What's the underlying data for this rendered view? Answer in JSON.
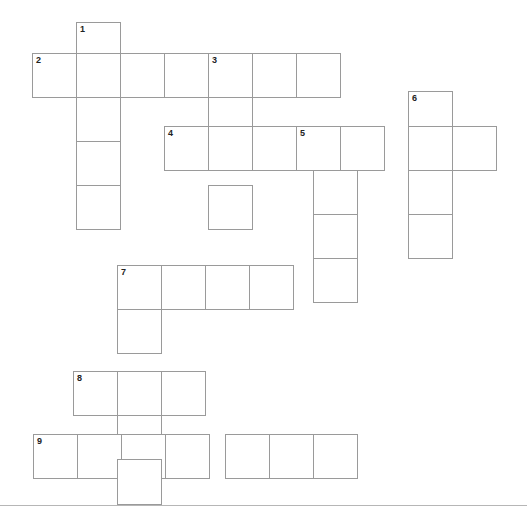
{
  "puzzle": {
    "title": "Crossword Puzzle Grid",
    "cell_size": 44.5,
    "origin_x": 32.5,
    "origin_y": 22,
    "columns": 11,
    "rows": 11,
    "grid_line_color": "#9a9a9a",
    "cell_fill_color": "#ffffff",
    "number_color": "#222222",
    "background_color": "#ffffff",
    "baseline_rule": {
      "y": 505,
      "color": "#b6b6b6"
    },
    "entries": [
      {
        "number": "1",
        "direction": "down",
        "col": 1,
        "row": 0,
        "length": 1
      },
      {
        "number": "2",
        "direction": "across",
        "col": 0,
        "row": 1,
        "length": 8
      },
      {
        "number": "3",
        "direction": "down",
        "col": 4,
        "row": 1,
        "length": 1
      },
      {
        "number": "4",
        "direction": "across",
        "col": 3,
        "row": 3,
        "length": 8
      },
      {
        "number": "5",
        "direction": "down",
        "col": 6,
        "row": 3,
        "length": 1
      },
      {
        "number": "6",
        "direction": "down",
        "col": 8,
        "row": 2,
        "length": 1
      },
      {
        "number": "7",
        "direction": "across",
        "col": 2,
        "row": 6,
        "length": 6
      },
      {
        "number": "8",
        "direction": "across",
        "col": 1,
        "row": 8,
        "length": 4
      },
      {
        "number": "9",
        "direction": "across",
        "col": 0,
        "row": 10,
        "length": 8
      }
    ],
    "cells": [
      {
        "name": "cell-r0c1",
        "x": 76,
        "y": 22,
        "w": 45,
        "h": 45,
        "number": "1",
        "letter": ""
      },
      {
        "name": "cell-r1c0",
        "x": 32,
        "y": 53,
        "w": 45,
        "h": 45,
        "number": "2",
        "letter": ""
      },
      {
        "name": "cell-r1c1",
        "x": 76,
        "y": 53,
        "w": 45,
        "h": 45,
        "number": "",
        "letter": ""
      },
      {
        "name": "cell-r1c2",
        "x": 120,
        "y": 53,
        "w": 45,
        "h": 45,
        "number": "",
        "letter": ""
      },
      {
        "name": "cell-r1c3",
        "x": 164,
        "y": 53,
        "w": 45,
        "h": 45,
        "number": "",
        "letter": ""
      },
      {
        "name": "cell-r1c4",
        "x": 208,
        "y": 53,
        "w": 45,
        "h": 45,
        "number": "3",
        "letter": ""
      },
      {
        "name": "cell-r1c5",
        "x": 252,
        "y": 53,
        "w": 45,
        "h": 45,
        "number": "",
        "letter": ""
      },
      {
        "name": "cell-r1c6",
        "x": 296,
        "y": 53,
        "w": 45,
        "h": 45,
        "number": "",
        "letter": ""
      },
      {
        "name": "cell-r2c1",
        "x": 76,
        "y": 97,
        "w": 45,
        "h": 45,
        "number": "",
        "letter": ""
      },
      {
        "name": "cell-r2c4",
        "x": 208,
        "y": 97,
        "w": 45,
        "h": 45,
        "number": "",
        "letter": ""
      },
      {
        "name": "cell-r2c8",
        "x": 408,
        "y": 91,
        "w": 45,
        "h": 45,
        "number": "6",
        "letter": ""
      },
      {
        "name": "cell-r3c1",
        "x": 76,
        "y": 141,
        "w": 45,
        "h": 45,
        "number": "",
        "letter": ""
      },
      {
        "name": "cell-r3c3",
        "x": 164,
        "y": 126,
        "w": 45,
        "h": 45,
        "number": "4",
        "letter": ""
      },
      {
        "name": "cell-r3c4",
        "x": 208,
        "y": 126,
        "w": 45,
        "h": 45,
        "number": "",
        "letter": ""
      },
      {
        "name": "cell-r3c5",
        "x": 252,
        "y": 126,
        "w": 45,
        "h": 45,
        "number": "",
        "letter": ""
      },
      {
        "name": "cell-r3c6",
        "x": 296,
        "y": 126,
        "w": 45,
        "h": 45,
        "number": "5",
        "letter": ""
      },
      {
        "name": "cell-r3c7",
        "x": 340,
        "y": 126,
        "w": 45,
        "h": 45,
        "number": "",
        "letter": ""
      },
      {
        "name": "cell-r3c8",
        "x": 408,
        "y": 126,
        "w": 45,
        "h": 45,
        "number": "",
        "letter": ""
      },
      {
        "name": "cell-r3c9",
        "x": 452,
        "y": 126,
        "w": 45,
        "h": 45,
        "number": "",
        "letter": ""
      },
      {
        "name": "cell-r4c1",
        "x": 76,
        "y": 185,
        "w": 45,
        "h": 45,
        "number": "",
        "letter": ""
      },
      {
        "name": "cell-r4c4",
        "x": 208,
        "y": 185,
        "w": 45,
        "h": 45,
        "number": "",
        "letter": ""
      },
      {
        "name": "cell-r4c6",
        "x": 313,
        "y": 170,
        "w": 45,
        "h": 45,
        "number": "",
        "letter": ""
      },
      {
        "name": "cell-r4c8",
        "x": 408,
        "y": 170,
        "w": 45,
        "h": 45,
        "number": "",
        "letter": ""
      },
      {
        "name": "cell-r5c6",
        "x": 313,
        "y": 214,
        "w": 45,
        "h": 45,
        "number": "",
        "letter": ""
      },
      {
        "name": "cell-r5c8",
        "x": 408,
        "y": 214,
        "w": 45,
        "h": 45,
        "number": "",
        "letter": ""
      },
      {
        "name": "cell-r6c2",
        "x": 117,
        "y": 265,
        "w": 45,
        "h": 45,
        "number": "7",
        "letter": ""
      },
      {
        "name": "cell-r6c3",
        "x": 161,
        "y": 265,
        "w": 45,
        "h": 45,
        "number": "",
        "letter": ""
      },
      {
        "name": "cell-r6c4",
        "x": 205,
        "y": 265,
        "w": 45,
        "h": 45,
        "number": "",
        "letter": ""
      },
      {
        "name": "cell-r6c5",
        "x": 249,
        "y": 265,
        "w": 45,
        "h": 45,
        "number": "",
        "letter": ""
      },
      {
        "name": "cell-r6c6",
        "x": 313,
        "y": 258,
        "w": 45,
        "h": 45,
        "number": "",
        "letter": ""
      },
      {
        "name": "cell-r7c2",
        "x": 117,
        "y": 309,
        "w": 45,
        "h": 45,
        "number": "",
        "letter": ""
      },
      {
        "name": "cell-r8c1",
        "x": 73,
        "y": 371,
        "w": 45,
        "h": 45,
        "number": "8",
        "letter": ""
      },
      {
        "name": "cell-r8c2",
        "x": 117,
        "y": 371,
        "w": 45,
        "h": 45,
        "number": "",
        "letter": ""
      },
      {
        "name": "cell-r8c3",
        "x": 161,
        "y": 371,
        "w": 45,
        "h": 45,
        "number": "",
        "letter": ""
      },
      {
        "name": "cell-r9c2",
        "x": 117,
        "y": 415,
        "w": 45,
        "h": 45,
        "number": "",
        "letter": ""
      },
      {
        "name": "cell-r10c0",
        "x": 33,
        "y": 434,
        "w": 45,
        "h": 45,
        "number": "9",
        "letter": ""
      },
      {
        "name": "cell-r10c1",
        "x": 77,
        "y": 434,
        "w": 45,
        "h": 45,
        "number": "",
        "letter": ""
      },
      {
        "name": "cell-r10c2",
        "x": 121,
        "y": 434,
        "w": 45,
        "h": 45,
        "number": "",
        "letter": ""
      },
      {
        "name": "cell-r10c3",
        "x": 165,
        "y": 434,
        "w": 45,
        "h": 45,
        "number": "",
        "letter": ""
      },
      {
        "name": "cell-r10c4",
        "x": 225,
        "y": 434,
        "w": 45,
        "h": 45,
        "number": "",
        "letter": ""
      },
      {
        "name": "cell-r10c5",
        "x": 269,
        "y": 434,
        "w": 45,
        "h": 45,
        "number": "",
        "letter": ""
      },
      {
        "name": "cell-r10c6",
        "x": 313,
        "y": 434,
        "w": 45,
        "h": 45,
        "number": "",
        "letter": ""
      },
      {
        "name": "cell-r11c2",
        "x": 117,
        "y": 459,
        "w": 45,
        "h": 46,
        "number": "",
        "letter": ""
      }
    ]
  }
}
